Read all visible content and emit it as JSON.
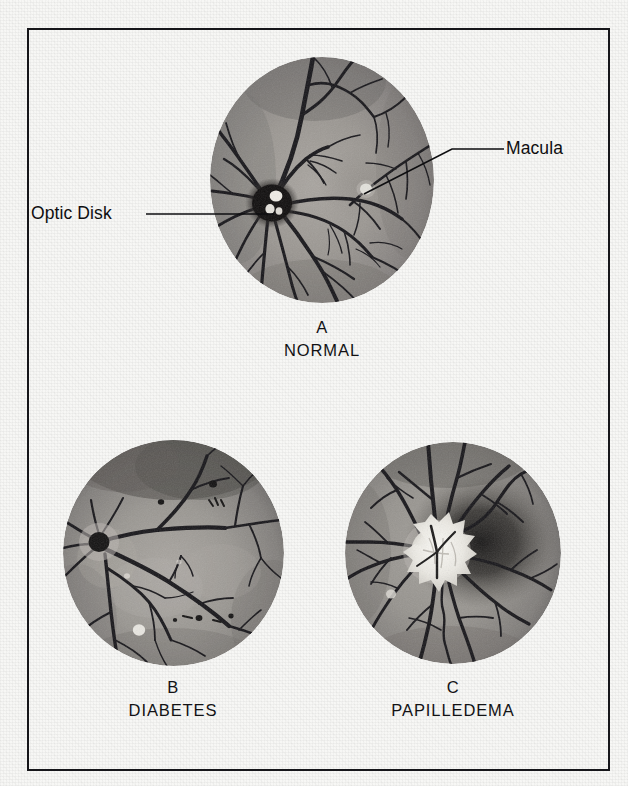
{
  "figure": {
    "kind": "medical-illustration",
    "frame_color": "#16161a",
    "page_color": "#f7f7f5"
  },
  "annotations": [
    {
      "id": "optic-disk",
      "label": "Optic Disk",
      "leader": "horizontal line pointing right into the optic disk of panel A"
    },
    {
      "id": "macula",
      "label": "Macula",
      "leader": "line angling down-left into the macula of panel A"
    }
  ],
  "panels": [
    {
      "id": "normal",
      "letter": "A",
      "name": "NORMAL",
      "fundus_tint": "#8e8a85",
      "disk_color": "#141212",
      "macula_color": "#efeee9",
      "description": "Normal fundus with dark optic disk and pale macula"
    },
    {
      "id": "diabetes",
      "letter": "B",
      "name": "DIABETES",
      "fundus_tint": "#8b8782",
      "disk_color": "#1a1818",
      "macula_color": "#e9e8e2",
      "description": "Diabetic retinopathy with dot hemorrhages and hard exudates"
    },
    {
      "id": "papilledema",
      "letter": "C",
      "name": "PAPILLEDEMA",
      "fundus_tint": "#8a8681",
      "disk_color": "#f2f0ea",
      "macula_color": "#d9d7d1",
      "description": "Swollen white optic disk with blurred margins"
    }
  ]
}
